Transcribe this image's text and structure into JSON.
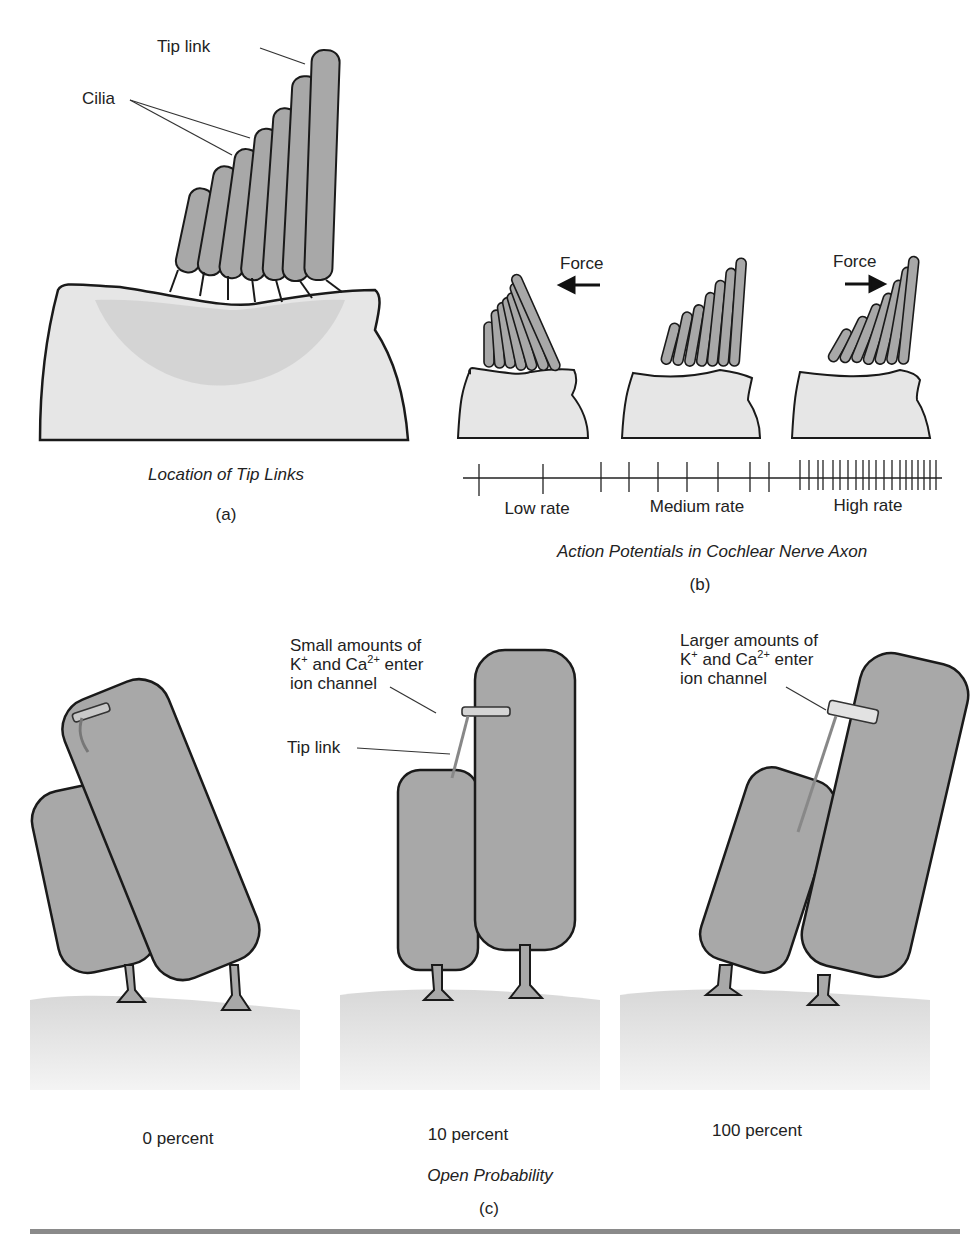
{
  "panel_a": {
    "tip_link_label": "Tip link",
    "cilia_label": "Cilia",
    "caption": "Location of Tip Links",
    "letter": "(a)"
  },
  "panel_b": {
    "force_left_label": "Force",
    "force_right_label": "Force",
    "rate_labels": [
      "Low rate",
      "Medium rate",
      "High rate"
    ],
    "caption": "Action Potentials in Cochlear Nerve Axon",
    "letter": "(b)"
  },
  "panel_c": {
    "small_line1": "Small amounts of",
    "small_k": "K",
    "small_k_sup": "+",
    "small_and": " and Ca",
    "small_ca_sup": "2+",
    "small_enter": " enter",
    "small_line3": "ion channel",
    "tip_link_label": "Tip link",
    "large_line1": "Larger amounts of",
    "large_k": "K",
    "large_k_sup": "+",
    "large_and": " and Ca",
    "large_ca_sup": "2+",
    "large_enter": " enter",
    "large_line3": "ion channel",
    "percent_labels": [
      "0 percent",
      "10 percent",
      "100 percent"
    ],
    "caption": "Open Probability",
    "letter": "(c)"
  },
  "colors": {
    "cilia_fill": "#a8a8a8",
    "cell_fill": "#e6e6e6",
    "cell_shade": "#cfcfcf",
    "outline": "#1a1a1a",
    "bottom_rule": "#8a8a8a"
  }
}
